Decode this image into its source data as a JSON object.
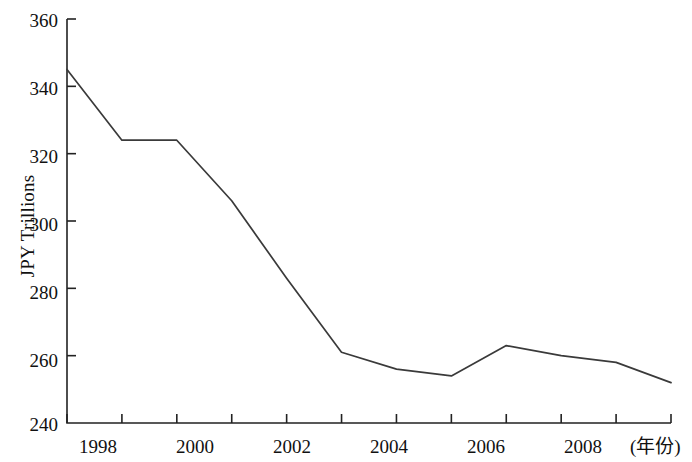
{
  "chart_data": {
    "type": "line",
    "title": "",
    "subtitle": "",
    "xlabel": "(年份)",
    "ylabel": "JPY Trillions",
    "x": [
      1998,
      1999,
      2000,
      2001,
      2002,
      2003,
      2004,
      2005,
      2006,
      2007,
      2008,
      2009
    ],
    "values": [
      345,
      324,
      324,
      306,
      283,
      261,
      256,
      254,
      263,
      260,
      258,
      252
    ],
    "series": [
      {
        "name": "JPY Trillions",
        "values": [
          345,
          324,
          324,
          306,
          283,
          261,
          256,
          254,
          263,
          260,
          258,
          252
        ]
      }
    ],
    "xlim": [
      1998,
      2009
    ],
    "ylim": [
      240,
      360
    ],
    "y_ticks": [
      240,
      260,
      280,
      300,
      320,
      340,
      360
    ],
    "y_tick_labels": [
      "240",
      "260",
      "280",
      "300",
      "320",
      "340",
      "360"
    ],
    "x_ticks": [
      1998,
      1999,
      2000,
      2001,
      2002,
      2003,
      2004,
      2005,
      2006,
      2007,
      2008,
      2009
    ],
    "x_tick_labels": [
      "1998",
      "",
      "2000",
      "",
      "2002",
      "",
      "2004",
      "",
      "2006",
      "",
      "2008",
      ""
    ],
    "x_labeled_ticks": [
      "1998",
      "2000",
      "2002",
      "2004",
      "2006",
      "2008"
    ],
    "grid": false,
    "legend": false,
    "legend_position": "none",
    "line_color": "#3a3a3a",
    "axis_color": "#222222",
    "background_color": "#ffffff",
    "annotations": []
  },
  "axes": {
    "y_label_text": "JPY Trillions",
    "x_label_text": "(年份)"
  }
}
